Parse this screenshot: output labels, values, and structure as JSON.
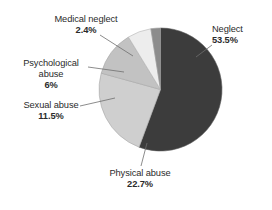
{
  "chart_data": {
    "type": "pie",
    "title": "",
    "subtitle": "",
    "xlabel": "",
    "ylabel": "",
    "legend_position": "none",
    "grid": false,
    "labels_inside": false,
    "units": "percent",
    "categories": [
      "Neglect",
      "Physical abuse",
      "Sexual abuse",
      "Psychological abuse",
      "Medical neglect"
    ],
    "values": [
      53.5,
      22.7,
      11.5,
      6,
      2.4
    ],
    "value_labels": [
      "53.5%",
      "22.7%",
      "11.5%",
      "6%",
      "2.4%"
    ],
    "colors": [
      "#3c3c3c",
      "#cfcfcf",
      "#c2c2c2",
      "#ededed",
      "#8c8c8c"
    ],
    "slices": [
      {
        "name": "Neglect",
        "value": 53.5,
        "value_label": "53.5%",
        "color": "#3c3c3c"
      },
      {
        "name": "Physical abuse",
        "value": 22.7,
        "value_label": "22.7%",
        "color": "#cfcfcf"
      },
      {
        "name": "Sexual abuse",
        "value": 11.5,
        "value_label": "11.5%",
        "color": "#c2c2c2"
      },
      {
        "name": "Psychological abuse",
        "value": 6,
        "value_label": "6%",
        "color": "#ededed"
      },
      {
        "name": "Medical neglect",
        "value": 2.4,
        "value_label": "2.4%",
        "color": "#8c8c8c"
      }
    ]
  },
  "labels": {
    "neglect": {
      "name": "Neglect",
      "pct": "53.5%"
    },
    "physical": {
      "name": "Physical abuse",
      "pct": "22.7%"
    },
    "sexual": {
      "name": "Sexual abuse",
      "pct": "11.5%"
    },
    "psychological": {
      "name_line1": "Psychological",
      "name_line2": "abuse",
      "pct": "6%"
    },
    "medical": {
      "name": "Medical neglect",
      "pct": "2.4%"
    }
  },
  "style": {
    "background": "#ffffff",
    "text_color": "#2b2b2b",
    "leader_line_color": "#6e6e6e",
    "pie_outline_color": "#9a9a9a"
  }
}
